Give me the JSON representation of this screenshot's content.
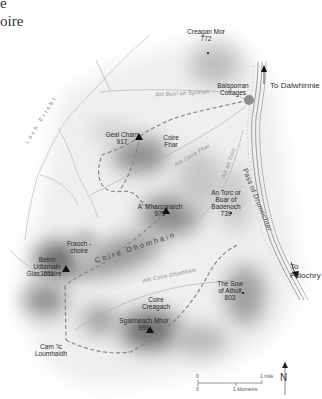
{
  "title_fragments": [
    "e",
    "oire"
  ],
  "peaks": [
    {
      "name": "Creagan Mor",
      "height": "772",
      "marker": "dot"
    },
    {
      "name": "Geal Charn",
      "height": "917",
      "marker": "triangle"
    },
    {
      "name": "A' Mharconaich",
      "height": "975",
      "marker": "triangle"
    },
    {
      "name": "An Torc or Boar of Badenoch",
      "height": "739",
      "marker": "dot"
    },
    {
      "name": "Beinn Udlamain",
      "height": "1011",
      "marker": "triangle"
    },
    {
      "name": "Sgairneach Mhor",
      "height": "991",
      "marker": "triangle"
    },
    {
      "name": "The Sow of Atholl",
      "height": "803",
      "marker": "dot"
    }
  ],
  "places": {
    "balsporran": "Balsporran Cottages",
    "coire_fhar": "Coire Fhar",
    "fraoch_choire": "Fraoch -choire",
    "glas_choire": "Glas -choire",
    "carn_lc": "Carn 'Ic Loumhaidh",
    "coire_creagach": "Coire Creagach"
  },
  "destinations": {
    "north": "To Dalwhinnie",
    "south": "To Pitlochry"
  },
  "water": {
    "allt_beul": "Allt Beul an Sporain",
    "allt_coire_fhar": "Allt Coire Fhar",
    "allt_an_tuirc": "Allt an Tuirc",
    "allt_coire_dhomhain": "Allt Coire Dhomhain",
    "loch": "Loch Ericht"
  },
  "valleys": {
    "coire_dhomhain": "Coire Dhomhain",
    "pass": "Pass of Drumochter"
  },
  "scale": {
    "zero_top": "0",
    "zero_bottom": "0",
    "mile": "1 mile",
    "km": "1 kilometre"
  },
  "north_label": "N",
  "colors": {
    "route": "#8a8a8a",
    "start_point": "#8c8c8c",
    "relief_dark": "#5a5a5a"
  }
}
